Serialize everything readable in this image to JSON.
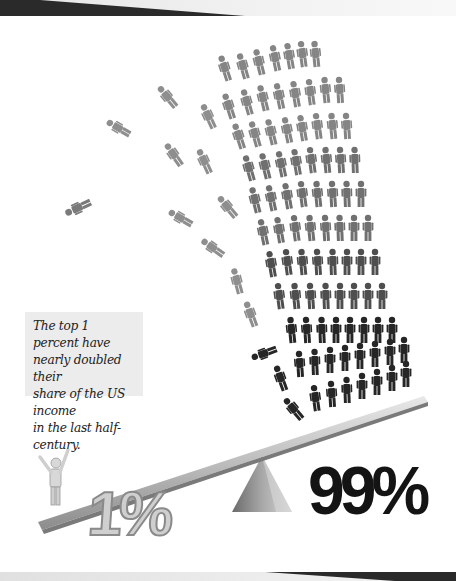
{
  "caption": {
    "lines": [
      "The top 1 percent have",
      "nearly doubled their",
      "share of the US income",
      "in the last half-century."
    ]
  },
  "labels": {
    "top_share": "1%",
    "rest_share": "99%"
  },
  "colors": {
    "background": "#ffffff",
    "caption_bg": "#ececec",
    "figure_light": "#9a9a9a",
    "figure_dark": "#1a1a1a",
    "band_dark": "#2a2a2a"
  }
}
